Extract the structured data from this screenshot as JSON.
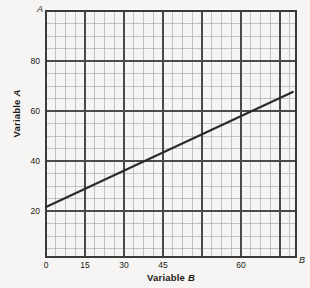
{
  "chart_data": {
    "type": "line",
    "title": "",
    "xlabel": "Variable B",
    "ylabel": "Variable A",
    "xlim": [
      0,
      77
    ],
    "ylim": [
      0,
      98.4
    ],
    "grid": true,
    "grid_major_x": 15,
    "grid_major_y": 20,
    "grid_minor_x": 3.75,
    "grid_minor_y": 5,
    "legend": "none",
    "x_ticks": [
      "0",
      "15",
      "30",
      "45",
      "60"
    ],
    "x_tick_values": [
      0,
      15,
      30,
      45,
      60
    ],
    "y_ticks": [
      "20",
      "40",
      "60",
      "80"
    ],
    "y_tick_values": [
      20,
      40,
      60,
      80
    ],
    "axis_end_labels": {
      "x": "B",
      "y": "A"
    },
    "series": [
      {
        "name": "line",
        "x": [
          0,
          15,
          30,
          45,
          60,
          76
        ],
        "values": [
          20,
          30,
          40,
          50,
          60,
          66
        ],
        "color": "#2b2b2b",
        "intercept": 20,
        "slope": 0.6667
      }
    ]
  },
  "labels": {
    "x_axis_title": "Variable ",
    "x_axis_title_italic": "B",
    "y_axis_title": "Variable ",
    "y_axis_title_italic": "A",
    "x_end": "B",
    "y_end": "A",
    "x0": "0",
    "x15": "15",
    "x30": "30",
    "x45": "45",
    "x60": "60",
    "y20": "20",
    "y40": "40",
    "y60": "60",
    "y80": "80"
  },
  "colors": {
    "background": "#f6f5f3",
    "axis": "#3a3a3a",
    "grid_major": "#555555",
    "grid_minor": "#9a9a9a",
    "line": "#2b2b2b",
    "text": "#1a1a1a"
  }
}
